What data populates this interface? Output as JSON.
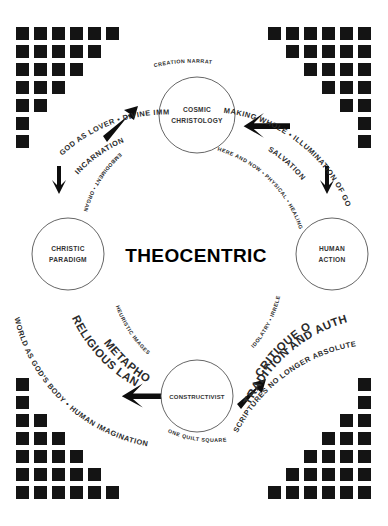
{
  "diagram": {
    "center_label": "THEOCENTRIC",
    "nodes": [
      {
        "id": "cosmic-christology",
        "line1": "COSMIC",
        "line2": "CHRISTOLOGY",
        "position": "top"
      },
      {
        "id": "christic-paradigm",
        "line1": "CHRISTIC",
        "line2": "PARADIGM",
        "position": "left"
      },
      {
        "id": "human-action",
        "line1": "HUMAN",
        "line2": "ACTION",
        "position": "right"
      },
      {
        "id": "constructivist",
        "line1": "CONSTRUCTIVIST",
        "line2": "",
        "position": "bottom"
      }
    ],
    "arc_labels": {
      "top_left_outer": "GOD AS LOVER • DIVINE IMMANENCE",
      "top_left_inner": "INCARNATION",
      "top_center_left": "CREATION NARRATIVE",
      "top_right_outer": "MAKING WHOLE • ILLUMINATION OF GOD'S LOVE",
      "top_right_inner": "SALVATION",
      "mid_left_inner": "EMBODIMENT • ORGANIC",
      "mid_right_inner": "HERE AND NOW • PHYSICAL • HEALING",
      "bottom_left_inner": "HEURISTIC IMAGES",
      "bottom_left_outer": "METAPHORICAL",
      "bottom_left_outer2": "RELIGIOUS LANGUAGE",
      "bottom_left_outer3": "WORLD AS GOD'S BODY • HUMAN IMAGINATION",
      "bottom_center_left": "ONE QUILT SQUARE",
      "bottom_right_inner": "IDOLATRY • IRRELEVANCE",
      "bottom_right_outer": "CRITIQUE OF",
      "bottom_right_outer2": "TRADITION AND AUTHORITY",
      "bottom_right_outer3": "SCRIPTURES NO LONGER ABSOLUTE"
    },
    "arrows": [
      {
        "id": "arrow-up-right",
        "direction": "up-right",
        "location": "top-left"
      },
      {
        "id": "arrow-left",
        "direction": "left",
        "location": "top-right"
      },
      {
        "id": "arrow-down-left",
        "direction": "down",
        "location": "mid-left"
      },
      {
        "id": "arrow-down-right",
        "direction": "down",
        "location": "mid-right"
      },
      {
        "id": "arrow-left-bottom",
        "direction": "left",
        "location": "bottom-center-left"
      },
      {
        "id": "arrow-up-right-bottom",
        "direction": "up-right",
        "location": "bottom-center-right"
      }
    ],
    "corner_patterns": {
      "top_left_rows": [
        7,
        5,
        4,
        3,
        2,
        1,
        1
      ],
      "top_right_rows": [
        6,
        5,
        4,
        3,
        2,
        1,
        1
      ],
      "bottom_left_rows": [
        1,
        1,
        2,
        3,
        4,
        5,
        7
      ],
      "bottom_right_rows": [
        1,
        1,
        2,
        3,
        4,
        5,
        7
      ]
    },
    "colors": {
      "square_fill": "#141414",
      "circle_stroke": "#4a4a4a",
      "text": "#2b2b2b",
      "background": "#ffffff"
    }
  }
}
